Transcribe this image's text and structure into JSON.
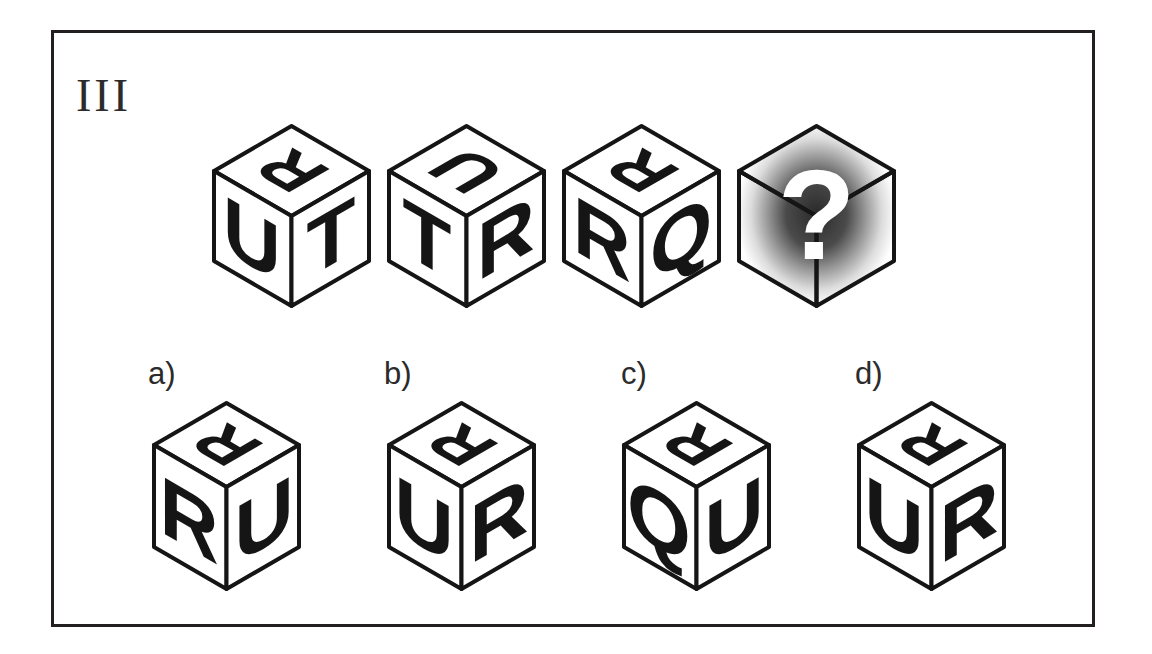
{
  "frame": {
    "label": "III",
    "border_color": "#231f20",
    "background": "#ffffff"
  },
  "ink_color": "#151515",
  "puzzle": {
    "type": "cube-rotation-sequence",
    "sequence_cubes": [
      {
        "name": "cube-1",
        "top": "R",
        "left": "U",
        "right": "T",
        "top_rotation": 180
      },
      {
        "name": "cube-2",
        "top": "U",
        "left": "T",
        "right": "R",
        "top_rotation": 180
      },
      {
        "name": "cube-3",
        "top": "R",
        "left": "R",
        "right": "Q",
        "top_rotation": 180
      },
      {
        "name": "cube-4-unknown",
        "top": "?",
        "left": "",
        "right": "",
        "top_rotation": 0,
        "shaded": true
      }
    ],
    "unknown_glyph": "?",
    "options": [
      {
        "key": "a",
        "label": "a)",
        "top": "R",
        "left": "R",
        "right": "U",
        "top_rotation": 180
      },
      {
        "key": "b",
        "label": "b)",
        "top": "R",
        "left": "U",
        "right": "R",
        "top_rotation": 180
      },
      {
        "key": "c",
        "label": "c)",
        "top": "R",
        "left": "Q",
        "right": "U",
        "top_rotation": 180
      },
      {
        "key": "d",
        "label": "d)",
        "top": "R",
        "left": "U",
        "right": "R",
        "top_rotation": 180
      }
    ]
  },
  "layout": {
    "question_row_positions": [
      {
        "x": 150,
        "y": 85
      },
      {
        "x": 325,
        "y": 85
      },
      {
        "x": 500,
        "y": 85
      },
      {
        "x": 675,
        "y": 85
      }
    ],
    "answer_row_positions": [
      {
        "x": 85,
        "y": 362
      },
      {
        "x": 320,
        "y": 362
      },
      {
        "x": 555,
        "y": 362
      },
      {
        "x": 790,
        "y": 362
      }
    ],
    "option_label_positions": [
      {
        "x": 94,
        "y": 325
      },
      {
        "x": 330,
        "y": 325
      },
      {
        "x": 567,
        "y": 325
      },
      {
        "x": 801,
        "y": 325
      }
    ]
  }
}
